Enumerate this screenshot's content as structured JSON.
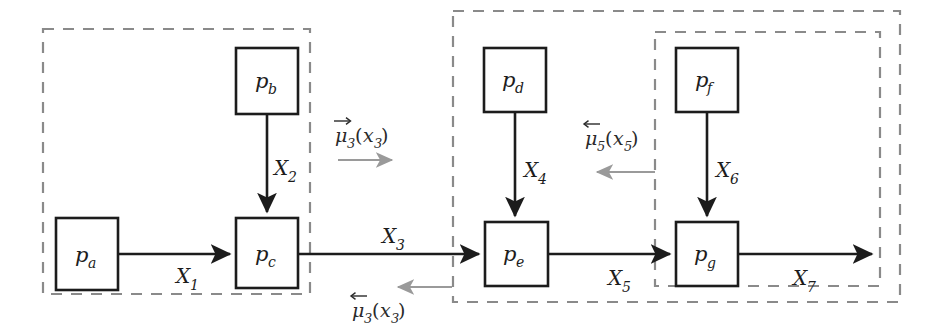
{
  "figure": {
    "canvas": {
      "width": 936,
      "height": 334
    },
    "colors": {
      "node_stroke": "#1c1c1c",
      "node_fill": "#ffffff",
      "group_dash": "#8a8a8a",
      "flow_arrow": "#1c1c1c",
      "message_arrow": "#9a9a9a",
      "background": "#ffffff"
    }
  },
  "nodes": [
    {
      "id": "pa",
      "base": "p",
      "sub": "a",
      "x": 56,
      "y": 218,
      "w": 62,
      "h": 72
    },
    {
      "id": "pb",
      "base": "p",
      "sub": "b",
      "x": 236,
      "y": 48,
      "w": 62,
      "h": 66
    },
    {
      "id": "pc",
      "base": "p",
      "sub": "c",
      "x": 236,
      "y": 218,
      "w": 62,
      "h": 70
    },
    {
      "id": "pd",
      "base": "p",
      "sub": "d",
      "x": 484,
      "y": 48,
      "w": 62,
      "h": 64
    },
    {
      "id": "pe",
      "base": "p",
      "sub": "e",
      "x": 485,
      "y": 222,
      "w": 63,
      "h": 64
    },
    {
      "id": "pf",
      "base": "p",
      "sub": "f",
      "x": 676,
      "y": 48,
      "w": 62,
      "h": 64
    },
    {
      "id": "pg",
      "base": "p",
      "sub": "g",
      "x": 676,
      "y": 222,
      "w": 62,
      "h": 64
    }
  ],
  "edges": [
    {
      "id": "X1",
      "base": "X",
      "sub": "1",
      "label_x": 183,
      "label_y": 283,
      "orientation": "horizontal"
    },
    {
      "id": "X2",
      "base": "X",
      "sub": "2",
      "label_x": 280,
      "label_y": 175,
      "orientation": "vertical"
    },
    {
      "id": "X3",
      "base": "X",
      "sub": "3",
      "label_x": 389,
      "label_y": 243,
      "orientation": "horizontal"
    },
    {
      "id": "X4",
      "base": "X",
      "sub": "4",
      "label_x": 531,
      "label_y": 177,
      "orientation": "vertical"
    },
    {
      "id": "X5",
      "base": "X",
      "sub": "5",
      "label_x": 615,
      "label_y": 285,
      "orientation": "horizontal"
    },
    {
      "id": "X6",
      "base": "X",
      "sub": "6",
      "label_x": 723,
      "label_y": 177,
      "orientation": "vertical"
    },
    {
      "id": "X7",
      "base": "X",
      "sub": "7",
      "label_x": 800,
      "label_y": 285,
      "orientation": "horizontal"
    }
  ],
  "messages": [
    {
      "id": "mu3-forward",
      "base": "mu",
      "sub": "3",
      "arg_base": "x",
      "arg_sub": "3",
      "accent": "right-arrow",
      "direction": "right",
      "label_x": 335,
      "label_y": 142,
      "arrow_x1": 338,
      "arrow_x2": 392,
      "arrow_y": 160
    },
    {
      "id": "mu3-backward",
      "base": "mu",
      "sub": "3",
      "arg_base": "x",
      "arg_sub": "3",
      "accent": "left-arrow",
      "direction": "left",
      "label_x": 352,
      "label_y": 317,
      "arrow_x1": 398,
      "arrow_x2": 452,
      "arrow_y": 287
    },
    {
      "id": "mu5-backward",
      "base": "mu",
      "sub": "5",
      "arg_base": "x",
      "arg_sub": "5",
      "accent": "left-arrow",
      "direction": "left",
      "label_x": 585,
      "label_y": 145,
      "arrow_x1": 597,
      "arrow_x2": 655,
      "arrow_y": 172
    }
  ],
  "groups": [
    {
      "id": "cluster-left",
      "x": 43,
      "y": 29,
      "w": 267,
      "h": 265,
      "role": "outer"
    },
    {
      "id": "cluster-middle",
      "x": 453,
      "y": 11,
      "w": 447,
      "h": 291,
      "role": "outer"
    },
    {
      "id": "cluster-inner",
      "x": 655,
      "y": 32,
      "w": 225,
      "h": 254,
      "role": "inner"
    }
  ],
  "glyphs": {
    "mu": "μ",
    "x_italic": "x",
    "X_italic": "X",
    "p_italic": "p",
    "left_paren": "(",
    "right_paren": ")"
  }
}
